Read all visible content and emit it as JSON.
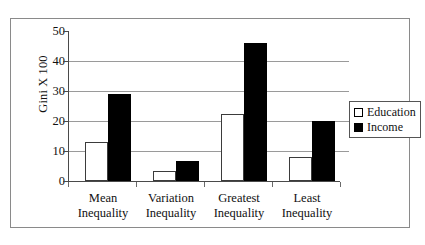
{
  "chart_data": {
    "type": "bar",
    "title": "",
    "xlabel": "",
    "ylabel": "Gini X 100",
    "ylim": [
      0,
      50
    ],
    "yticks": [
      0,
      10,
      20,
      30,
      40,
      50
    ],
    "grid": true,
    "legend_position": "right",
    "categories": [
      "Mean Inequality",
      "Variation Inequality",
      "Greatest Inequality",
      "Least Inequality"
    ],
    "category_lines": [
      {
        "line1": "Mean",
        "line2": "Inequality"
      },
      {
        "line1": "Variation",
        "line2": "Inequality"
      },
      {
        "line1": "Greatest",
        "line2": "Inequality"
      },
      {
        "line1": "Least",
        "line2": "Inequality"
      }
    ],
    "series": [
      {
        "name": "Education",
        "color": "#ffffff",
        "values": [
          13,
          3.5,
          22.5,
          8
        ]
      },
      {
        "name": "Income",
        "color": "#000000",
        "values": [
          29,
          6.7,
          46,
          20
        ]
      }
    ]
  },
  "legend": {
    "items": [
      {
        "label": "Education",
        "swatch": "white-square-icon"
      },
      {
        "label": "Income",
        "swatch": "black-square-icon"
      }
    ]
  },
  "axis": {
    "y_title": "Gini X 100",
    "y_tick_labels": [
      "50",
      "40",
      "30",
      "20",
      "10",
      "0"
    ]
  }
}
